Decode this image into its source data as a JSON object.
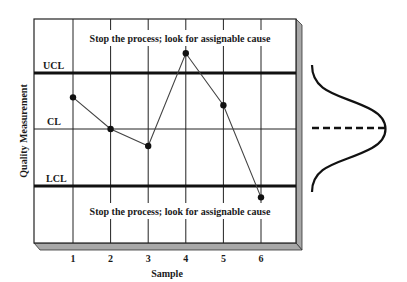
{
  "chart_data": {
    "type": "line",
    "title": "",
    "xlabel": "Sample",
    "ylabel": "Quality Measurement",
    "categories": [
      "1",
      "2",
      "3",
      "4",
      "5",
      "6"
    ],
    "x": [
      1,
      2,
      3,
      4,
      5,
      6
    ],
    "series": [
      {
        "name": "Quality Measurement",
        "values": [
          0.56,
          0.0,
          -0.3,
          1.34,
          0.42,
          -1.21
        ]
      }
    ],
    "control_limits": {
      "UCL": 1.0,
      "CL": 0.0,
      "LCL": -1.0
    },
    "ylim": [
      -1.93,
      1.93
    ],
    "grid": true,
    "legend": null,
    "annotations": [
      {
        "text": "Stop the process; look for assignable cause",
        "position": "above UCL"
      },
      {
        "text": "Stop the process; look for assignable cause",
        "position": "below LCL"
      }
    ],
    "side_figure": "normal distribution curve centered on CL with dashed center line"
  },
  "labels": {
    "ucl": "UCL",
    "cl": "CL",
    "lcl": "LCL",
    "top_annotation": "Stop the process; look for assignable cause",
    "bottom_annotation": "Stop the process; look for assignable cause",
    "x_axis_title": "Sample",
    "y_axis_title": "Quality Measurement",
    "x_ticks": [
      "1",
      "2",
      "3",
      "4",
      "5",
      "6"
    ]
  },
  "colors": {
    "line": "#111111",
    "grid": "#222222",
    "frame_edge": "#a8a8a8",
    "background": "#ffffff"
  }
}
